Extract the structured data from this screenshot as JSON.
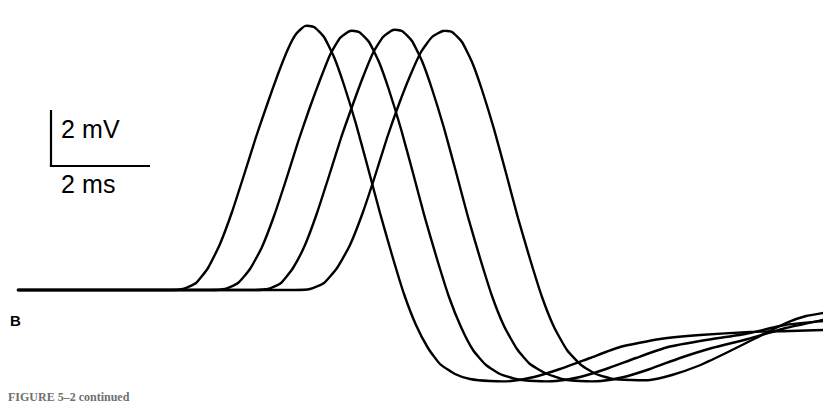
{
  "figure": {
    "panel_label": "B",
    "caption": "FIGURE 5–2 continued",
    "background_color": "#ffffff",
    "trace_color": "#000000",
    "trace_width_px": 2.4
  },
  "scalebar": {
    "vertical_label": "2 mV",
    "horizontal_label": "2 ms",
    "corner_x": 51,
    "top_y": 110,
    "bottom_y": 166,
    "right_x": 150,
    "color": "#000000",
    "width_px": 2.2
  },
  "chart_data": {
    "type": "line",
    "title": "",
    "subtitle": "",
    "xlabel": "Time",
    "ylabel": "Membrane potential",
    "grid": false,
    "legend_position": "none",
    "axes_visible": false,
    "scale_vertical": "2 mV",
    "scale_horizontal": "2 ms",
    "baseline_y_px": 290,
    "units_per_pixel": {
      "mV_per_px": 0.0357,
      "ms_per_px": 0.0202
    },
    "n_series": 4,
    "annotations": [
      "B"
    ],
    "series": [
      {
        "name": "trace-1",
        "onset_x_px": 183,
        "peak_x_px": 305,
        "peak_y_px": 26,
        "peak_mV": 9.4,
        "trough_x_px": 511,
        "trough_y_px": 381,
        "trough_mV": -3.2,
        "end_x_px": 823,
        "end_y_px": 330,
        "end_mV": -1.4,
        "points": [
          [
            18,
            290
          ],
          [
            120,
            290
          ],
          [
            170,
            290
          ],
          [
            183,
            289
          ],
          [
            196,
            283
          ],
          [
            208,
            268
          ],
          [
            220,
            244
          ],
          [
            232,
            212
          ],
          [
            244,
            175
          ],
          [
            256,
            137
          ],
          [
            268,
            102
          ],
          [
            278,
            74
          ],
          [
            288,
            49
          ],
          [
            296,
            34
          ],
          [
            305,
            26
          ],
          [
            314,
            27
          ],
          [
            324,
            37
          ],
          [
            334,
            57
          ],
          [
            344,
            85
          ],
          [
            356,
            124
          ],
          [
            368,
            168
          ],
          [
            380,
            213
          ],
          [
            392,
            255
          ],
          [
            404,
            294
          ],
          [
            416,
            325
          ],
          [
            428,
            348
          ],
          [
            440,
            364
          ],
          [
            455,
            374
          ],
          [
            470,
            379
          ],
          [
            490,
            381
          ],
          [
            511,
            381
          ],
          [
            534,
            377
          ],
          [
            560,
            369
          ],
          [
            590,
            358
          ],
          [
            620,
            347
          ],
          [
            660,
            339
          ],
          [
            700,
            335
          ],
          [
            750,
            332
          ],
          [
            790,
            331
          ],
          [
            823,
            330
          ]
        ]
      },
      {
        "name": "trace-2",
        "onset_x_px": 225,
        "peak_x_px": 350,
        "peak_y_px": 31,
        "peak_mV": 9.2,
        "trough_x_px": 556,
        "trough_y_px": 381,
        "trough_mV": -3.2,
        "end_x_px": 823,
        "end_y_px": 321,
        "end_mV": -1.1,
        "points": [
          [
            18,
            290
          ],
          [
            150,
            290
          ],
          [
            210,
            290
          ],
          [
            225,
            289
          ],
          [
            238,
            283
          ],
          [
            250,
            269
          ],
          [
            262,
            247
          ],
          [
            274,
            216
          ],
          [
            286,
            180
          ],
          [
            298,
            142
          ],
          [
            310,
            107
          ],
          [
            320,
            80
          ],
          [
            330,
            55
          ],
          [
            340,
            38
          ],
          [
            350,
            31
          ],
          [
            359,
            32
          ],
          [
            369,
            42
          ],
          [
            379,
            62
          ],
          [
            389,
            90
          ],
          [
            401,
            129
          ],
          [
            413,
            173
          ],
          [
            425,
            218
          ],
          [
            437,
            259
          ],
          [
            449,
            297
          ],
          [
            461,
            327
          ],
          [
            473,
            350
          ],
          [
            486,
            365
          ],
          [
            500,
            374
          ],
          [
            516,
            379
          ],
          [
            535,
            381
          ],
          [
            556,
            381
          ],
          [
            580,
            377
          ],
          [
            606,
            369
          ],
          [
            636,
            358
          ],
          [
            668,
            347
          ],
          [
            706,
            340
          ],
          [
            745,
            334
          ],
          [
            785,
            325
          ],
          [
            823,
            321
          ]
        ]
      },
      {
        "name": "trace-3",
        "onset_x_px": 268,
        "peak_x_px": 393,
        "peak_y_px": 30,
        "peak_mV": 9.3,
        "trough_x_px": 601,
        "trough_y_px": 381,
        "trough_mV": -3.2,
        "end_x_px": 823,
        "end_y_px": 320,
        "end_mV": -1.1,
        "points": [
          [
            18,
            290
          ],
          [
            180,
            290
          ],
          [
            252,
            290
          ],
          [
            268,
            289
          ],
          [
            281,
            283
          ],
          [
            293,
            268
          ],
          [
            305,
            245
          ],
          [
            317,
            213
          ],
          [
            329,
            176
          ],
          [
            341,
            138
          ],
          [
            353,
            104
          ],
          [
            363,
            77
          ],
          [
            373,
            53
          ],
          [
            383,
            37
          ],
          [
            393,
            30
          ],
          [
            402,
            31
          ],
          [
            412,
            41
          ],
          [
            422,
            61
          ],
          [
            432,
            89
          ],
          [
            444,
            128
          ],
          [
            456,
            172
          ],
          [
            468,
            217
          ],
          [
            480,
            258
          ],
          [
            492,
            296
          ],
          [
            504,
            326
          ],
          [
            517,
            349
          ],
          [
            530,
            364
          ],
          [
            545,
            373
          ],
          [
            562,
            379
          ],
          [
            580,
            381
          ],
          [
            601,
            381
          ],
          [
            624,
            377
          ],
          [
            650,
            369
          ],
          [
            680,
            358
          ],
          [
            712,
            348
          ],
          [
            748,
            339
          ],
          [
            786,
            328
          ],
          [
            823,
            320
          ]
        ]
      },
      {
        "name": "trace-4",
        "onset_x_px": 310,
        "peak_x_px": 443,
        "peak_y_px": 31,
        "peak_mV": 9.2,
        "trough_x_px": 650,
        "trough_y_px": 380,
        "trough_mV": -3.2,
        "end_x_px": 823,
        "end_y_px": 313,
        "end_mV": -0.8,
        "points": [
          [
            18,
            290
          ],
          [
            220,
            290
          ],
          [
            294,
            290
          ],
          [
            310,
            289
          ],
          [
            324,
            283
          ],
          [
            337,
            268
          ],
          [
            350,
            245
          ],
          [
            363,
            212
          ],
          [
            375,
            176
          ],
          [
            387,
            138
          ],
          [
            399,
            104
          ],
          [
            410,
            76
          ],
          [
            421,
            52
          ],
          [
            432,
            37
          ],
          [
            443,
            31
          ],
          [
            452,
            32
          ],
          [
            462,
            42
          ],
          [
            472,
            62
          ],
          [
            482,
            90
          ],
          [
            494,
            129
          ],
          [
            506,
            173
          ],
          [
            518,
            218
          ],
          [
            530,
            259
          ],
          [
            542,
            297
          ],
          [
            554,
            327
          ],
          [
            567,
            350
          ],
          [
            581,
            365
          ],
          [
            596,
            374
          ],
          [
            613,
            379
          ],
          [
            631,
            380
          ],
          [
            650,
            380
          ],
          [
            672,
            375
          ],
          [
            698,
            366
          ],
          [
            726,
            353
          ],
          [
            756,
            338
          ],
          [
            786,
            323
          ],
          [
            806,
            316
          ],
          [
            823,
            313
          ]
        ]
      }
    ]
  }
}
